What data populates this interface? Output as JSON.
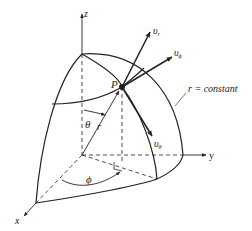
{
  "diagram": {
    "axes": {
      "z_label": "z",
      "y_label": "y",
      "x_label": "x"
    },
    "point_label": "P",
    "radius_label": "r",
    "theta_label": "θ",
    "phi_label": "ϕ",
    "surface_label": "r = constant",
    "vectors": {
      "v_r": {
        "main": "υ",
        "sub": "r"
      },
      "v_phi": {
        "main": "υ",
        "sub": "ϕ"
      },
      "v_theta": {
        "main": "υ",
        "sub": "θ"
      }
    },
    "colors": {
      "line": "#222222",
      "background": "#ffffff"
    }
  }
}
